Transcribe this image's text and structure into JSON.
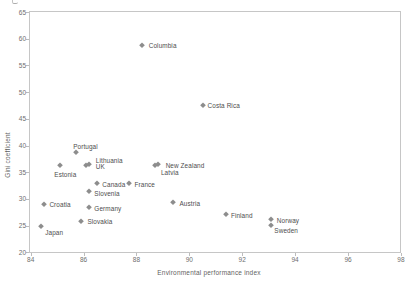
{
  "chart_data": {
    "type": "scatter",
    "title": "",
    "xlabel": "Environmental performance index",
    "ylabel": "Gini coefficient",
    "xlim": [
      84,
      98
    ],
    "ylim": [
      20,
      65
    ],
    "x_ticks": [
      84,
      86,
      88,
      90,
      92,
      94,
      96,
      98
    ],
    "y_ticks": [
      65,
      60,
      55,
      50,
      45,
      40,
      35,
      30,
      25,
      20
    ],
    "grid": false,
    "legend": "none",
    "marker": "diamond",
    "marker_color": "#8d8d8d",
    "point_label_color": "#4d4d4d",
    "tick_label_color": "#6e6e6e",
    "axis_color": "#c6c6c6",
    "points": [
      {
        "label": "Columbia",
        "x": 88.2,
        "y": 58.9,
        "label_offset": [
          7,
          -3
        ]
      },
      {
        "label": "Costa Rica",
        "x": 90.5,
        "y": 47.6,
        "label_offset": [
          5,
          -2.5
        ]
      },
      {
        "label": "Portugal",
        "x": 85.7,
        "y": 38.8,
        "label_offset": [
          -2.5,
          -9
        ]
      },
      {
        "label": "Estonia",
        "x": 85.1,
        "y": 36.4,
        "label_offset": [
          -5.5,
          6
        ]
      },
      {
        "label": "Lithuania",
        "x": 86.2,
        "y": 36.6,
        "label_offset": [
          7,
          -6.5
        ]
      },
      {
        "label": "UK",
        "x": 86.1,
        "y": 36.3,
        "label_offset": [
          9.5,
          -2
        ]
      },
      {
        "label": "New Zealand",
        "x": 88.8,
        "y": 36.6,
        "label_offset": [
          8,
          -2
        ]
      },
      {
        "label": "Latvia",
        "x": 88.7,
        "y": 36.3,
        "label_offset": [
          6,
          4
        ]
      },
      {
        "label": "Canada",
        "x": 86.5,
        "y": 32.9,
        "label_offset": [
          5.5,
          -2
        ]
      },
      {
        "label": "France",
        "x": 87.7,
        "y": 33.0,
        "label_offset": [
          6,
          -2
        ]
      },
      {
        "label": "Slovenia",
        "x": 86.2,
        "y": 31.4,
        "label_offset": [
          5.5,
          -1.5
        ]
      },
      {
        "label": "Croatia",
        "x": 84.5,
        "y": 29.1,
        "label_offset": [
          5.5,
          -2.5
        ]
      },
      {
        "label": "Austria",
        "x": 89.4,
        "y": 29.5,
        "label_offset": [
          6,
          -2
        ]
      },
      {
        "label": "Germany",
        "x": 86.2,
        "y": 28.4,
        "label_offset": [
          5.5,
          -2
        ]
      },
      {
        "label": "Slovakia",
        "x": 85.9,
        "y": 25.9,
        "label_offset": [
          6.5,
          -2.5
        ]
      },
      {
        "label": "Japan",
        "x": 84.4,
        "y": 25.0,
        "label_offset": [
          4,
          3.5
        ]
      },
      {
        "label": "Finland",
        "x": 91.4,
        "y": 27.1,
        "label_offset": [
          4.5,
          -2
        ]
      },
      {
        "label": "Norway",
        "x": 93.1,
        "y": 26.2,
        "label_offset": [
          5.5,
          -2
        ]
      },
      {
        "label": "Sweden",
        "x": 93.1,
        "y": 25.2,
        "label_offset": [
          3,
          2.5
        ]
      }
    ]
  }
}
